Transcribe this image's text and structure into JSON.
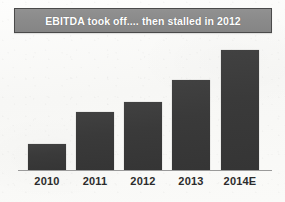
{
  "title": {
    "text": "EBITDA took off.... then stalled in 2012"
  },
  "colors": {
    "bar_fill": "#3a3a3a",
    "title_background": "#8a8a8a",
    "title_border": "#4a4a4a",
    "title_text": "#ffffff",
    "axis_line": "#9a9a9a",
    "label_text": "#2c2c2c",
    "page_background": "#fbfbfa"
  },
  "chart_data": {
    "type": "bar",
    "title": "EBITDA took off.... then stalled in 2012",
    "categories": [
      "2010",
      "2011",
      "2012",
      "2013",
      "2014E"
    ],
    "values": [
      26,
      58,
      68,
      90,
      120
    ],
    "series": [
      {
        "name": "EBITDA",
        "values": [
          26,
          58,
          68,
          90,
          120
        ]
      }
    ],
    "xlabel": "",
    "ylabel": "",
    "ylim": [
      0,
      130
    ],
    "grid": false,
    "legend": false,
    "y_axis_visible": false,
    "y_tick_labels": [],
    "annotations": []
  },
  "bars": [
    {
      "label": "2010",
      "value": 26,
      "x": 28,
      "width": 38
    },
    {
      "label": "2011",
      "value": 58,
      "x": 76,
      "width": 38
    },
    {
      "label": "2012",
      "value": 68,
      "x": 124,
      "width": 38
    },
    {
      "label": "2013",
      "value": 90,
      "x": 172,
      "width": 38
    },
    {
      "label": "2014E",
      "value": 120,
      "x": 221,
      "width": 38
    }
  ],
  "axis": {
    "baseline_y": 170,
    "left": 18,
    "width": 254
  }
}
